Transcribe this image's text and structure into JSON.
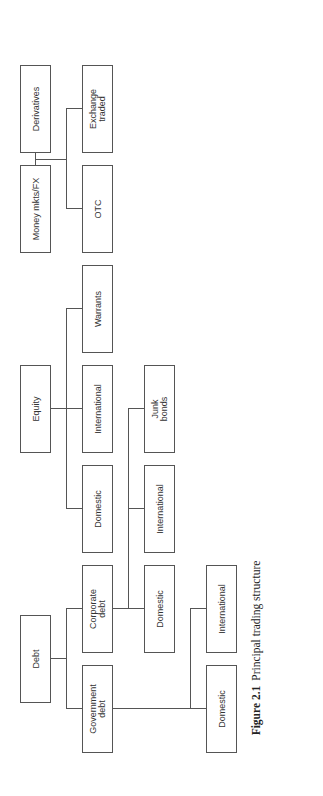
{
  "diagram": {
    "orientation": "rotated -90deg (reads bottom-to-top)",
    "top_level": [
      {
        "label": "Debt"
      },
      {
        "label": "Equity"
      },
      {
        "label": "Money mkts/FX"
      },
      {
        "label": "Derivatives"
      }
    ],
    "debt": {
      "children": [
        {
          "label": "Government\ndebt",
          "children": [
            {
              "label": "Domestic"
            },
            {
              "label": "International"
            }
          ]
        },
        {
          "label": "Corporate\ndebt",
          "children": [
            {
              "label": "Domestic"
            },
            {
              "label": "International"
            },
            {
              "label": "Junk\nbonds"
            }
          ]
        }
      ]
    },
    "equity": {
      "children": [
        {
          "label": "Domestic"
        },
        {
          "label": "International"
        },
        {
          "label": "Warrants"
        }
      ]
    },
    "derivatives": {
      "children": [
        {
          "label": "OTC"
        },
        {
          "label": "Exchange\ntraded"
        }
      ]
    }
  },
  "caption": {
    "figure_label": "Figure 2.1",
    "text": "Principal trading structure"
  }
}
